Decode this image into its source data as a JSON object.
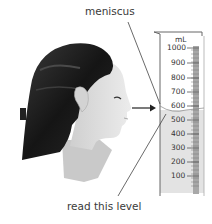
{
  "labels": {
    "meniscus": "meniscus",
    "read_level": "read this level"
  },
  "cylinder": {
    "unit": "mL",
    "ticks": [
      "1000",
      "900",
      "800",
      "700",
      "600",
      "500",
      "400",
      "300",
      "200",
      "100"
    ],
    "liquid_level_ml": 550,
    "liquid_color": "#dcdcdc",
    "scale_color": "#9a9a9a"
  },
  "figure": {
    "arrow": "line of sight arrow pointing to the meniscus"
  }
}
